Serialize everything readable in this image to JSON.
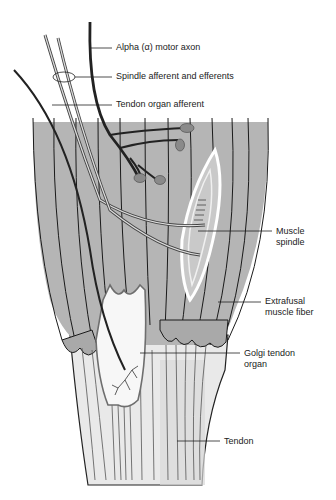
{
  "diagram": {
    "colors": {
      "muscle": "#b5b5b5",
      "muscle_dark": "#a8a8a8",
      "tendon": "#e8e8e8",
      "axon": "#333333",
      "ending": "#8a8a8a",
      "golgi_outline": "#6e6e6e",
      "background": "#ffffff"
    },
    "labels": {
      "alpha_motor_axon": "Alpha (α) motor axon",
      "spindle_afferent": "Spindle afferent and efferents",
      "tendon_organ_afferent": "Tendon organ afferent",
      "muscle_spindle_1": "Muscle",
      "muscle_spindle_2": "spindle",
      "extrafusal_1": "Extrafusal",
      "extrafusal_2": "muscle fiber",
      "golgi_1": "Golgi tendon",
      "golgi_2": "organ",
      "tendon": "Tendon"
    }
  }
}
